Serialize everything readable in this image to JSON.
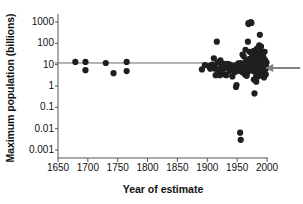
{
  "chart_data": {
    "type": "scatter",
    "title": "",
    "xlabel": "Year of estimate",
    "ylabel": "Maximum population (billions)",
    "yscale": "log",
    "xlim": [
      1640,
      2010
    ],
    "ylim": [
      0.0008,
      2000
    ],
    "xticks": [
      1650,
      1700,
      1750,
      1800,
      1850,
      1900,
      1950,
      2000
    ],
    "xtick_labels": [
      "1650",
      "1700",
      "1750",
      "1800",
      "1850",
      "1900",
      "1950",
      "2000"
    ],
    "yticks": [
      1000,
      100,
      10,
      1,
      0.1,
      0.01,
      0.001
    ],
    "ytick_labels": [
      "1000",
      "100",
      "10",
      "1",
      "0.1",
      "0.01",
      "0.001"
    ],
    "grid": false,
    "legend": null,
    "marker_color": "#1f1f1f",
    "marker_size": 3.1,
    "annotations": [
      {
        "type": "hline",
        "name": "reference-line-12-billion",
        "y": 12,
        "x_start": 1645,
        "x_end": 2005,
        "color": "#666666"
      },
      {
        "type": "arrow",
        "name": "current-estimate-arrow",
        "points_to_x": 1997,
        "points_to_y": 7,
        "from_x": 2012,
        "color": "#808080"
      }
    ],
    "points": [
      [
        1679,
        13.5
      ],
      [
        1696,
        13.5
      ],
      [
        1696,
        5.5
      ],
      [
        1730,
        12.0
      ],
      [
        1743,
        4.0
      ],
      [
        1765,
        5.0
      ],
      [
        1765,
        13.5
      ],
      [
        1891,
        6.0
      ],
      [
        1896,
        9.5
      ],
      [
        1903,
        8.5
      ],
      [
        1908,
        10.0
      ],
      [
        1911,
        20.0
      ],
      [
        1912,
        9.0
      ],
      [
        1913,
        6.5
      ],
      [
        1914,
        3.2
      ],
      [
        1916,
        120.0
      ],
      [
        1917,
        13.0
      ],
      [
        1918,
        6.0
      ],
      [
        1919,
        5.5
      ],
      [
        1920,
        6.0
      ],
      [
        1921,
        3.2
      ],
      [
        1922,
        16.0
      ],
      [
        1923,
        10.5
      ],
      [
        1924,
        5.5
      ],
      [
        1925,
        9.5
      ],
      [
        1926,
        10.0
      ],
      [
        1927,
        6.5
      ],
      [
        1928,
        11.0
      ],
      [
        1929,
        3.5
      ],
      [
        1930,
        8.0
      ],
      [
        1931,
        10.0
      ],
      [
        1932,
        3.2
      ],
      [
        1934,
        11.0
      ],
      [
        1936,
        6.5
      ],
      [
        1938,
        10.0
      ],
      [
        1940,
        6.0
      ],
      [
        1942,
        2.8
      ],
      [
        1944,
        5.5
      ],
      [
        1945,
        9.0
      ],
      [
        1946,
        4.5
      ],
      [
        1948,
        0.9
      ],
      [
        1949,
        1.1
      ],
      [
        1950,
        5.0
      ],
      [
        1951,
        7.0
      ],
      [
        1952,
        8.0
      ],
      [
        1953,
        6.0
      ],
      [
        1954,
        10.0
      ],
      [
        1955,
        0.0065
      ],
      [
        1956,
        0.003
      ],
      [
        1955,
        5.5
      ],
      [
        1956,
        12.0
      ],
      [
        1957,
        7.5
      ],
      [
        1958,
        4.5
      ],
      [
        1959,
        30.0
      ],
      [
        1960,
        9.0
      ],
      [
        1961,
        25.0
      ],
      [
        1962,
        6.0
      ],
      [
        1963,
        3.5
      ],
      [
        1964,
        50.0
      ],
      [
        1965,
        15.0
      ],
      [
        1966,
        9.0
      ],
      [
        1967,
        7.0
      ],
      [
        1968,
        120.0
      ],
      [
        1969,
        900.0
      ],
      [
        1969,
        800.0
      ],
      [
        1970,
        18.0
      ],
      [
        1971,
        40.0
      ],
      [
        1972,
        6.0
      ],
      [
        1973,
        1000.0
      ],
      [
        1974,
        900.0
      ],
      [
        1974,
        35.0
      ],
      [
        1975,
        10.0
      ],
      [
        1975,
        22.0
      ],
      [
        1976,
        8.0
      ],
      [
        1976,
        30.0
      ],
      [
        1977,
        5.0
      ],
      [
        1977,
        16.0
      ],
      [
        1978,
        7.5
      ],
      [
        1978,
        45.0
      ],
      [
        1979,
        11.0
      ],
      [
        1979,
        0.45
      ],
      [
        1980,
        25.0
      ],
      [
        1980,
        6.0
      ],
      [
        1981,
        9.0
      ],
      [
        1981,
        40.0
      ],
      [
        1982,
        13.0
      ],
      [
        1982,
        3.0
      ],
      [
        1983,
        7.0
      ],
      [
        1983,
        55.0
      ],
      [
        1984,
        20.0
      ],
      [
        1984,
        5.5
      ],
      [
        1985,
        12.0
      ],
      [
        1985,
        2.8
      ],
      [
        1986,
        8.5
      ],
      [
        1986,
        30.0
      ],
      [
        1987,
        6.0
      ],
      [
        1987,
        16.0
      ],
      [
        1988,
        10.0
      ],
      [
        1988,
        250.0
      ],
      [
        1989,
        7.0
      ],
      [
        1989,
        45.0
      ],
      [
        1990,
        9.0
      ],
      [
        1990,
        20.0
      ],
      [
        1991,
        5.0
      ],
      [
        1991,
        14.0
      ],
      [
        1992,
        7.5
      ],
      [
        1992,
        35.0
      ],
      [
        1993,
        11.0
      ],
      [
        1993,
        3.0
      ],
      [
        1994,
        6.5
      ],
      [
        1994,
        22.0
      ],
      [
        1995,
        8.0
      ],
      [
        1995,
        2.5
      ],
      [
        1996,
        12.0
      ],
      [
        1996,
        40.0
      ],
      [
        1997,
        6.0
      ],
      [
        1997,
        16.0
      ],
      [
        1998,
        9.0
      ],
      [
        1998,
        3.5
      ],
      [
        1999,
        7.0
      ],
      [
        1999,
        13.0
      ],
      [
        1987,
        80.0
      ],
      [
        1985,
        60.0
      ],
      [
        1990,
        70.0
      ],
      [
        1978,
        2.0
      ],
      [
        1982,
        1.6
      ],
      [
        1986,
        5.0
      ],
      [
        1993,
        26.0
      ],
      [
        1968,
        4.5
      ],
      [
        1964,
        11.0
      ],
      [
        1972,
        13.0
      ],
      [
        1966,
        3.0
      ],
      [
        1952,
        11.5
      ],
      [
        1948,
        5.0
      ],
      [
        1937,
        5.0
      ],
      [
        1905,
        6.5
      ]
    ]
  }
}
